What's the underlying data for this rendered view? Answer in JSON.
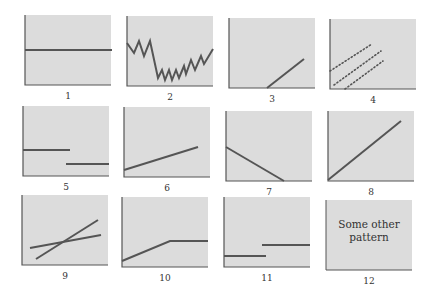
{
  "colors": {
    "fill": "#dcdcdc",
    "axis": "#555555",
    "line": "#555555",
    "label": "#333333"
  },
  "panels": [
    {
      "id": 1,
      "label": "1",
      "x": 25,
      "y": 15,
      "lines": [
        {
          "points": "0,35 87,35"
        }
      ]
    },
    {
      "id": 2,
      "label": "2",
      "x": 127,
      "y": 16,
      "lines": [
        {
          "points": "0,27 7,37 12,25 17,40 23,25 31,62 35,54 38,64 42,54 45,64 49,54 52,62 57,50 59,58 64,44 68,54 74,40 77,48 86,33"
        }
      ]
    },
    {
      "id": 3,
      "label": "3",
      "x": 229,
      "y": 18,
      "lines": [
        {
          "points": "38,70 75,41"
        }
      ]
    },
    {
      "id": 4,
      "label": "4",
      "x": 330,
      "y": 19,
      "lines": [
        {
          "points": "0,52 42,25",
          "dotted": true
        },
        {
          "points": "4,66 51,32",
          "dotted": true
        },
        {
          "points": "15,70 53,42",
          "dotted": true
        }
      ]
    },
    {
      "id": 5,
      "label": "5",
      "x": 23,
      "y": 106,
      "lines": [
        {
          "points": "0,44 47,44"
        },
        {
          "points": "43,58 86,58"
        }
      ]
    },
    {
      "id": 6,
      "label": "6",
      "x": 124,
      "y": 107,
      "lines": [
        {
          "points": "0,63 74,40"
        }
      ]
    },
    {
      "id": 7,
      "label": "7",
      "x": 226,
      "y": 111,
      "lines": [
        {
          "points": "0,36 58,70"
        }
      ]
    },
    {
      "id": 8,
      "label": "8",
      "x": 328,
      "y": 111,
      "lines": [
        {
          "points": "0,69 73,10"
        }
      ]
    },
    {
      "id": 9,
      "label": "9",
      "x": 22,
      "y": 195,
      "lines": [
        {
          "points": "14,64 76,25"
        },
        {
          "points": "8,53 79,40"
        }
      ]
    },
    {
      "id": 10,
      "label": "10",
      "x": 122,
      "y": 197,
      "lines": [
        {
          "points": "0,64 48,44 86,44"
        }
      ]
    },
    {
      "id": 11,
      "label": "11",
      "x": 224,
      "y": 197,
      "lines": [
        {
          "points": "0,59 42,59"
        },
        {
          "points": "38,48 86,48"
        }
      ]
    },
    {
      "id": 12,
      "label": "12",
      "x": 326,
      "y": 200,
      "text": [
        "Some other",
        "pattern"
      ],
      "lines": []
    }
  ]
}
